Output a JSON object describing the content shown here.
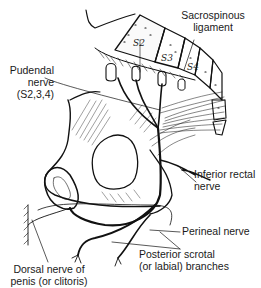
{
  "figure": {
    "labels": {
      "sacrospinous": [
        "Sacrospinous",
        "ligament"
      ],
      "pudendal": [
        "Pudendal",
        "nerve",
        "(S2,3,4)"
      ],
      "inferior_rectal": [
        "Inferior rectal",
        "nerve"
      ],
      "perineal": [
        "Perineal nerve"
      ],
      "posterior_scrotal": [
        "Posterior scrotal",
        "(or labial) branches"
      ],
      "dorsal": [
        "Dorsal nerve of",
        "penis (or clitoris)"
      ]
    },
    "vertebra_labels": [
      "S2",
      "S3",
      "S4"
    ],
    "colors": {
      "ink": "#111111",
      "background": "#ffffff"
    }
  }
}
